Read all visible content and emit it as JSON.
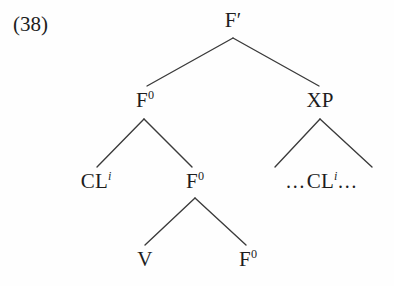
{
  "figure": {
    "example_number": "(38)",
    "background_color": "#fefefe",
    "line_color": "#3a3a3a",
    "text_color": "#1d1d1d"
  },
  "tree": {
    "nodes": {
      "root": {
        "label": "F",
        "prime": "′",
        "x": 233,
        "y": 20
      },
      "f0_left": {
        "label": "F",
        "superscript": "0",
        "x": 145,
        "y": 100
      },
      "xp": {
        "label": "XP",
        "x": 320,
        "y": 100
      },
      "cl_spec": {
        "label": "CL",
        "superscript": "i",
        "x": 96,
        "y": 181
      },
      "f0_mid": {
        "label": "F",
        "superscript": "0",
        "x": 195,
        "y": 181
      },
      "cl_trace": {
        "pre": "…",
        "label": "CL",
        "superscript": "i",
        "post": "…",
        "x": 322,
        "y": 181
      },
      "v": {
        "label": "V",
        "x": 145,
        "y": 259
      },
      "f0_bottom": {
        "label": "F",
        "superscript": "0",
        "x": 248,
        "y": 259
      }
    },
    "edges": [
      {
        "name": "root-to-f0",
        "x1": 233,
        "y1": 38,
        "x2": 147,
        "y2": 86
      },
      {
        "name": "root-to-xp",
        "x1": 233,
        "y1": 38,
        "x2": 319,
        "y2": 86
      },
      {
        "name": "f0-to-cl",
        "x1": 144,
        "y1": 119,
        "x2": 97,
        "y2": 167
      },
      {
        "name": "f0-to-f0mid",
        "x1": 144,
        "y1": 119,
        "x2": 192,
        "y2": 167
      },
      {
        "name": "xp-to-left",
        "x1": 320,
        "y1": 119,
        "x2": 275,
        "y2": 167
      },
      {
        "name": "xp-to-right",
        "x1": 320,
        "y1": 119,
        "x2": 372,
        "y2": 167
      },
      {
        "name": "f0mid-to-v",
        "x1": 195,
        "y1": 198,
        "x2": 145,
        "y2": 245
      },
      {
        "name": "f0mid-to-f0bottom",
        "x1": 195,
        "y1": 198,
        "x2": 246,
        "y2": 245
      }
    ]
  }
}
